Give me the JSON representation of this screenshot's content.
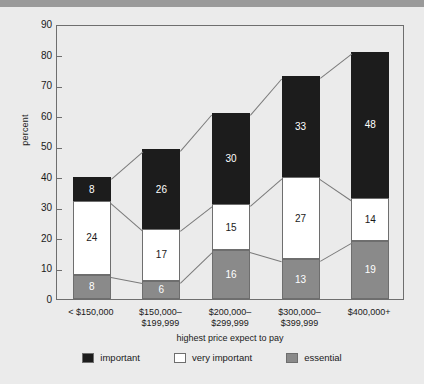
{
  "chart_data": {
    "type": "bar",
    "subtype": "stacked-bar",
    "title": "",
    "xlabel": "highest price expect to pay",
    "ylabel": "percent",
    "ylim": [
      0,
      90
    ],
    "yticks": [
      0,
      10,
      20,
      30,
      40,
      50,
      60,
      70,
      80,
      90
    ],
    "grid": false,
    "legend_position": "bottom",
    "categories": [
      "< $150,000",
      "$150,000–$199,999",
      "$200,000–$299,999",
      "$300,000–$399,999",
      "$400,000+"
    ],
    "category_lines": [
      [
        "< $150,000"
      ],
      [
        "$150,000–",
        "$199,999"
      ],
      [
        "$200,000–",
        "$299,999"
      ],
      [
        "$300,000–",
        "$399,999"
      ],
      [
        "$400,000+"
      ]
    ],
    "stack_order_bottom_to_top": [
      "essential",
      "very important",
      "important"
    ],
    "series": [
      {
        "name": "essential",
        "color": "#8a8a8a",
        "values": [
          8,
          6,
          16,
          13,
          19
        ]
      },
      {
        "name": "very important",
        "color": "#ffffff",
        "values": [
          24,
          17,
          15,
          27,
          14
        ]
      },
      {
        "name": "important",
        "color": "#1c1c1c",
        "values": [
          8,
          26,
          30,
          33,
          48
        ]
      }
    ],
    "totals": [
      40,
      49,
      61,
      73,
      81
    ]
  },
  "legend": {
    "items": [
      {
        "label": "important",
        "color": "#1c1c1c"
      },
      {
        "label": "very important",
        "color": "#ffffff"
      },
      {
        "label": "essential",
        "color": "#8a8a8a"
      }
    ]
  },
  "axes": {
    "y_title": "percent",
    "x_title": "highest price expect to pay",
    "y_tick_labels": [
      "90",
      "80",
      "70",
      "60",
      "50",
      "40",
      "30",
      "20",
      "10",
      "0"
    ]
  }
}
